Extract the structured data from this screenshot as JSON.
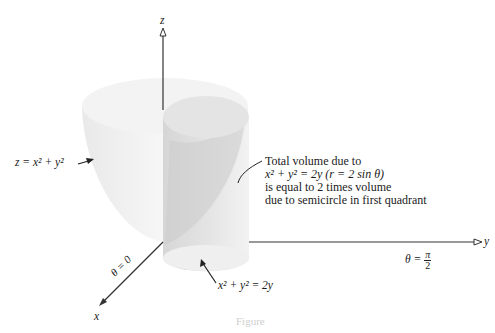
{
  "axes": {
    "z_label": "z",
    "y_label": "y",
    "x_label": "x",
    "theta_zero": "θ = 0",
    "theta_pi2_prefix": "θ =",
    "theta_pi2_num": "π",
    "theta_pi2_den": "2"
  },
  "labels": {
    "paraboloid": "z = x² + y²",
    "base_circle": "x² + y² = 2y",
    "note_line1": "Total volume due to",
    "note_line2": "x² + y² = 2y (r = 2 sin θ)",
    "note_line3": "is equal to 2 times volume",
    "note_line4": "due to semicircle in first quadrant"
  },
  "caption": "Figure",
  "colors": {
    "paraboloid_fill": "#efefef",
    "cylinder_fill": "#dcdcdc",
    "axis": "#333333"
  }
}
